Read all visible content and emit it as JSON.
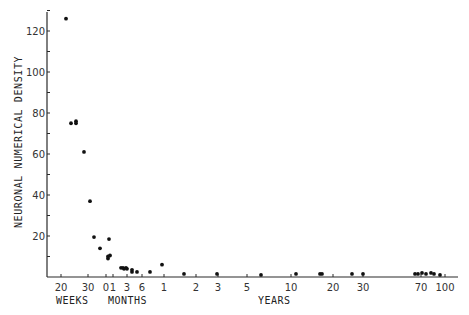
{
  "chart_data": {
    "type": "scatter",
    "title": "",
    "ylabel": "NEURONAL NUMERICAL DENSITY",
    "xlabel_segments": [
      "WEEKS",
      "MONTHS",
      "YEARS"
    ],
    "ylim": [
      0,
      130
    ],
    "yticks": [
      20,
      40,
      60,
      80,
      100,
      120
    ],
    "xticks": [
      {
        "label": "20",
        "unit": "weeks",
        "px": 61
      },
      {
        "label": "30",
        "unit": "weeks",
        "px": 88
      },
      {
        "label": "0",
        "unit": "months",
        "px": 106
      },
      {
        "label": "1",
        "unit": "months",
        "px": 113
      },
      {
        "label": "3",
        "unit": "months",
        "px": 127
      },
      {
        "label": "6",
        "unit": "months",
        "px": 142
      },
      {
        "label": "1",
        "unit": "years",
        "px": 164
      },
      {
        "label": "2",
        "unit": "years",
        "px": 196
      },
      {
        "label": "3",
        "unit": "years",
        "px": 218
      },
      {
        "label": "5",
        "unit": "years",
        "px": 247
      },
      {
        "label": "10",
        "unit": "years",
        "px": 291
      },
      {
        "label": "20",
        "unit": "years",
        "px": 333
      },
      {
        "label": "30",
        "unit": "years",
        "px": 363
      },
      {
        "label": "70",
        "unit": "years",
        "px": 421
      },
      {
        "label": "100",
        "unit": "years",
        "px": 445
      }
    ],
    "grid": false,
    "legend": null,
    "x_scale": "piecewise log age (gestational weeks, postnatal months, years)",
    "points": [
      {
        "age": "~22 weeks",
        "px": 66,
        "y": 126
      },
      {
        "age": "~26 weeks",
        "px": 71,
        "y": 75
      },
      {
        "age": "~27 weeks",
        "px": 76,
        "y": 76
      },
      {
        "age": "~27 weeks",
        "px": 76,
        "y": 75
      },
      {
        "age": "~29 weeks",
        "px": 84,
        "y": 61
      },
      {
        "age": "~31 weeks",
        "px": 90,
        "y": 37
      },
      {
        "age": "~33 weeks",
        "px": 94,
        "y": 19.5
      },
      {
        "age": "~36 weeks",
        "px": 100,
        "y": 14
      },
      {
        "age": "~0 months",
        "px": 108,
        "y": 9
      },
      {
        "age": "~0 months",
        "px": 108,
        "y": 10
      },
      {
        "age": "~0 months",
        "px": 110,
        "y": 10.5
      },
      {
        "age": "~0 months",
        "px": 109,
        "y": 18.5
      },
      {
        "age": "~2 months",
        "px": 121,
        "y": 4.5
      },
      {
        "age": "~2 months",
        "px": 123,
        "y": 4.5
      },
      {
        "age": "~2.5 months",
        "px": 124,
        "y": 4
      },
      {
        "age": "~3 months",
        "px": 126,
        "y": 4.5
      },
      {
        "age": "~3 months",
        "px": 127,
        "y": 4
      },
      {
        "age": "~4 months",
        "px": 132,
        "y": 3.5
      },
      {
        "age": "~4 months",
        "px": 132,
        "y": 2.5
      },
      {
        "age": "~5 months",
        "px": 137,
        "y": 2.5
      },
      {
        "age": "~8 months",
        "px": 150,
        "y": 2.5
      },
      {
        "age": "~1 year",
        "px": 162,
        "y": 6
      },
      {
        "age": "~1.5 years",
        "px": 184,
        "y": 1.5
      },
      {
        "age": "~3 years",
        "px": 217,
        "y": 1.5
      },
      {
        "age": "~6.5 years",
        "px": 261,
        "y": 1
      },
      {
        "age": "~11 years",
        "px": 296,
        "y": 1.5
      },
      {
        "age": "~17 years",
        "px": 320,
        "y": 1.5
      },
      {
        "age": "~17 years",
        "px": 322,
        "y": 1.5
      },
      {
        "age": "~25 years",
        "px": 352,
        "y": 1.5
      },
      {
        "age": "~30 years",
        "px": 363,
        "y": 1.5
      },
      {
        "age": "~68 years",
        "px": 415,
        "y": 1.5
      },
      {
        "age": "~70 years",
        "px": 418,
        "y": 1.5
      },
      {
        "age": "~72 years",
        "px": 422,
        "y": 2
      },
      {
        "age": "~75 years",
        "px": 426,
        "y": 1.5
      },
      {
        "age": "~80 years",
        "px": 431,
        "y": 2
      },
      {
        "age": "~83 years",
        "px": 434,
        "y": 1.5
      },
      {
        "age": "~90 years",
        "px": 440,
        "y": 1
      }
    ]
  },
  "labels": {
    "ylabel": "NEURONAL NUMERICAL DENSITY",
    "weeks": "WEEKS",
    "months": "MONTHS",
    "years": "YEARS"
  }
}
